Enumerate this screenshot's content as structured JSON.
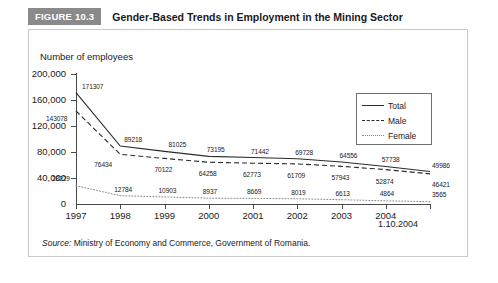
{
  "header": {
    "badge": "FIGURE 10.3",
    "title": "Gender-Based Trends in Employment in the Mining Sector",
    "badge_color": "#8a8a8a"
  },
  "source": {
    "label": "Source:",
    "text": " Ministry of Economy and Commerce, Government of Romania."
  },
  "legend": {
    "position": "top-right",
    "items": [
      {
        "label": "Total",
        "style": "solid"
      },
      {
        "label": "Male",
        "style": "dashed"
      },
      {
        "label": "Female",
        "style": "dotted"
      }
    ]
  },
  "chart_data": {
    "type": "line",
    "title": "Gender-Based Trends in Employment in the Mining Sector",
    "xlabel": "",
    "ylabel": "Number of employees",
    "categories": [
      "1997",
      "1998",
      "1999",
      "2000",
      "2001",
      "2002",
      "2003",
      "2004",
      "1.10.2004"
    ],
    "xtick_labels": [
      "1997",
      "1998",
      "1999",
      "2000",
      "2001",
      "2002",
      "2003",
      "2004"
    ],
    "final_x_label": "1.10.2004",
    "ylim": [
      0,
      200000
    ],
    "yticks": [
      0,
      40000,
      80000,
      120000,
      160000,
      200000
    ],
    "ytick_labels": [
      "0",
      "40,000",
      "80,000",
      "120,000",
      "160,000",
      "200,000"
    ],
    "grid": false,
    "series": [
      {
        "name": "Total",
        "style": "solid",
        "color": "#2b2b2b",
        "values": [
          171307,
          89218,
          81025,
          73195,
          71442,
          69728,
          64556,
          57738,
          49986
        ]
      },
      {
        "name": "Male",
        "style": "dashed",
        "color": "#2b2b2b",
        "values": [
          143078,
          76434,
          70122,
          64258,
          62773,
          61709,
          57943,
          52874,
          46421
        ]
      },
      {
        "name": "Female",
        "style": "dotted",
        "color": "#8a8a8a",
        "values": [
          28229,
          12784,
          10903,
          8937,
          8669,
          8019,
          6613,
          4864,
          3565
        ]
      }
    ],
    "point_labels": {
      "Total": [
        "171307",
        "89218",
        "81025",
        "73195",
        "71442",
        "69728",
        "64556",
        "57738",
        "49986"
      ],
      "Male": [
        "143078",
        "76434",
        "70122",
        "64258",
        "62773",
        "61709",
        "57943",
        "52874",
        "46421"
      ],
      "Female": [
        "28229",
        "12784",
        "10903",
        "8937",
        "8669",
        "8019",
        "6613",
        "4864",
        "3565"
      ]
    }
  }
}
